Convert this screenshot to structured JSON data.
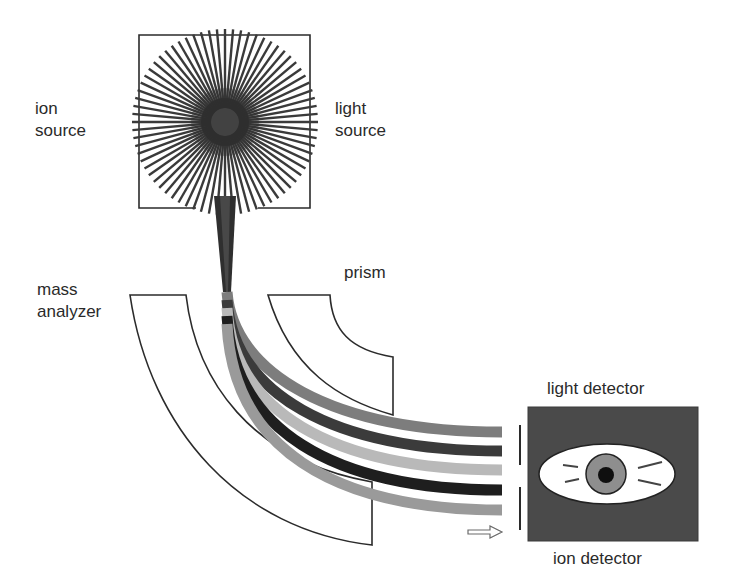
{
  "labels": {
    "ion_source": {
      "line1": "ion",
      "line2": "source"
    },
    "light_source": {
      "line1": "light",
      "line2": "source"
    },
    "mass_analyzer": {
      "line1": "mass",
      "line2": "analyzer"
    },
    "prism": "prism",
    "light_detector": "light detector",
    "ion_detector": "ion detector"
  },
  "icons": {
    "source": "sunburst-icon",
    "detector": "eye-icon",
    "direction": "hollow-right-arrow-icon"
  },
  "colors": {
    "outline": "#2b2b2b",
    "sunburst": "#3a3a3a",
    "sunburst_core": "#2e2e2e",
    "beam_trunk": "#2f2f2f",
    "beams": [
      "#7d7d7d",
      "#3b3b3b",
      "#b9b9b9",
      "#1e1e1e",
      "#9a9a9a"
    ],
    "detector_bg": "#4a4a4a",
    "eye_white": "#ffffff",
    "iris": "#8e8e8e",
    "pupil": "#0f0f0f"
  },
  "beams": [
    {
      "name": "beam-1",
      "d": "M227,292 C233,372 330,432 502,432"
    },
    {
      "name": "beam-2",
      "d": "M227,300 C233,392 330,451 502,451"
    },
    {
      "name": "beam-3",
      "d": "M227,308 C233,410 330,470 502,470"
    },
    {
      "name": "beam-4",
      "d": "M227,316 C233,428 330,490 502,490"
    },
    {
      "name": "beam-5",
      "d": "M227,324 C233,446 330,510 502,510"
    }
  ]
}
